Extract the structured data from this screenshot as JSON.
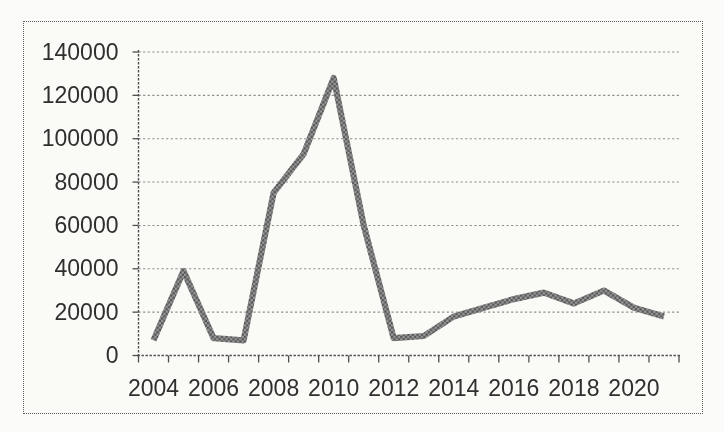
{
  "page": {
    "background_color": "#fbfbf9",
    "border_color": "#5c5c5c",
    "text_color": "#2f2f2f"
  },
  "chart_data": {
    "type": "line",
    "x": [
      2004,
      2005,
      2006,
      2007,
      2008,
      2009,
      2010,
      2011,
      2012,
      2013,
      2014,
      2015,
      2016,
      2017,
      2018,
      2019,
      2020,
      2021
    ],
    "values": [
      7000,
      39000,
      8000,
      7000,
      75000,
      93000,
      128000,
      60000,
      8000,
      9000,
      18000,
      22000,
      26000,
      29000,
      24000,
      30000,
      22000,
      18000
    ],
    "series": [
      {
        "name": "series-1",
        "values": [
          7000,
          39000,
          8000,
          7000,
          75000,
          93000,
          128000,
          60000,
          8000,
          9000,
          18000,
          22000,
          26000,
          29000,
          24000,
          30000,
          22000,
          18000
        ]
      }
    ],
    "y_ticks": [
      0,
      20000,
      40000,
      60000,
      80000,
      100000,
      120000,
      140000
    ],
    "y_tick_labels": [
      "0",
      "20000",
      "40000",
      "60000",
      "80000",
      "100000",
      "120000",
      "140000"
    ],
    "x_label_years": [
      2004,
      2006,
      2008,
      2010,
      2012,
      2014,
      2016,
      2018,
      2020
    ],
    "x_tick_labels": [
      "2004",
      "2006",
      "2008",
      "2010",
      "2012",
      "2014",
      "2016",
      "2018",
      "2020"
    ],
    "ylim": [
      0,
      140000
    ],
    "grid": "horizontal-dotted",
    "legend": "none",
    "line_style": {
      "stroke_width": 6.2,
      "texture_dark": "#565656",
      "texture_light": "#9a9a9a"
    },
    "grid_color": "#8d8d8d",
    "axis_color": "#4e4e4e"
  }
}
